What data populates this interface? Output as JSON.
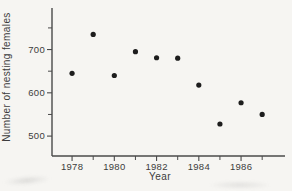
{
  "page": {
    "background_color": "#f6f5f2"
  },
  "chart_data": {
    "type": "scatter",
    "title": "",
    "xlabel": "Year",
    "ylabel": "Number of nesting females",
    "x": [
      1978,
      1979,
      1980,
      1981,
      1982,
      1983,
      1984,
      1985,
      1986,
      1987
    ],
    "y": [
      645,
      735,
      640,
      695,
      681,
      680,
      618,
      528,
      577,
      550
    ],
    "xlim": [
      1977.05,
      1988.08
    ],
    "ylim": [
      454,
      796
    ],
    "xticks": {
      "major": [
        {
          "value": 1978,
          "label": "1978"
        },
        {
          "value": 1980,
          "label": "1980"
        },
        {
          "value": 1982,
          "label": "1982"
        },
        {
          "value": 1984,
          "label": "1984"
        },
        {
          "value": 1986,
          "label": "1986"
        }
      ],
      "minor": [
        1979,
        1981,
        1983,
        1985,
        1987
      ]
    },
    "yticks": {
      "major": [
        {
          "value": 500,
          "label": "500"
        },
        {
          "value": 600,
          "label": "600"
        },
        {
          "value": 700,
          "label": "700"
        }
      ],
      "minor": [
        550,
        650,
        750
      ]
    },
    "grid": false,
    "legend": null,
    "point_color": "#1d1d1d",
    "axis_color": "#4a4a4a",
    "text_color": "#3c3c3c"
  }
}
